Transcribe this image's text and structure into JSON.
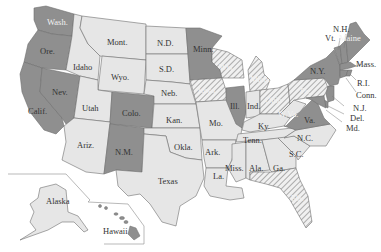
{
  "map": {
    "title": "",
    "colors": {
      "dark": "#8f8f8f",
      "light": "#e6e6e6",
      "hatch_bg": "#f0f0f0",
      "hatch_line": "#9a9a9a",
      "border": "#6f6f6f",
      "background": "#ffffff"
    },
    "categories": [
      "dark",
      "light",
      "hatched"
    ],
    "states": [
      {
        "name": "Wash.",
        "fill": "dark"
      },
      {
        "name": "Ore.",
        "fill": "dark"
      },
      {
        "name": "Calif.",
        "fill": "dark"
      },
      {
        "name": "Nev.",
        "fill": "dark"
      },
      {
        "name": "Idaho",
        "fill": "light"
      },
      {
        "name": "Mont.",
        "fill": "light"
      },
      {
        "name": "Wyo.",
        "fill": "light"
      },
      {
        "name": "Utah",
        "fill": "light"
      },
      {
        "name": "Colo.",
        "fill": "dark"
      },
      {
        "name": "Ariz.",
        "fill": "light"
      },
      {
        "name": "N.M.",
        "fill": "dark"
      },
      {
        "name": "N.D.",
        "fill": "light"
      },
      {
        "name": "S.D.",
        "fill": "light"
      },
      {
        "name": "Neb.",
        "fill": "light"
      },
      {
        "name": "Kan.",
        "fill": "light"
      },
      {
        "name": "Okla.",
        "fill": "light"
      },
      {
        "name": "Texas",
        "fill": "light"
      },
      {
        "name": "Minn.",
        "fill": "dark"
      },
      {
        "name": "Iowa",
        "fill": "hatched"
      },
      {
        "name": "Mo.",
        "fill": "light"
      },
      {
        "name": "Ark.",
        "fill": "light"
      },
      {
        "name": "La.",
        "fill": "light"
      },
      {
        "name": "Wis.",
        "fill": "hatched"
      },
      {
        "name": "Ill.",
        "fill": "dark"
      },
      {
        "name": "Mich.",
        "fill": "hatched"
      },
      {
        "name": "Ind.",
        "fill": "light"
      },
      {
        "name": "Ohio",
        "fill": "hatched"
      },
      {
        "name": "Ky.",
        "fill": "light"
      },
      {
        "name": "Tenn.",
        "fill": "light"
      },
      {
        "name": "Miss.",
        "fill": "light"
      },
      {
        "name": "Ala.",
        "fill": "light"
      },
      {
        "name": "Ga.",
        "fill": "light"
      },
      {
        "name": "Fla.",
        "fill": "hatched"
      },
      {
        "name": "S.C.",
        "fill": "light"
      },
      {
        "name": "N.C.",
        "fill": "light"
      },
      {
        "name": "Va.",
        "fill": "dark"
      },
      {
        "name": "W.Va.",
        "fill": "light"
      },
      {
        "name": "Pa.",
        "fill": "hatched"
      },
      {
        "name": "N.Y.",
        "fill": "dark"
      },
      {
        "name": "Vt.",
        "fill": "dark"
      },
      {
        "name": "N.H.",
        "fill": "dark"
      },
      {
        "name": "Maine",
        "fill": "dark"
      },
      {
        "name": "Mass.",
        "fill": "dark"
      },
      {
        "name": "R.I.",
        "fill": "dark"
      },
      {
        "name": "Conn.",
        "fill": "dark"
      },
      {
        "name": "N.J.",
        "fill": "dark"
      },
      {
        "name": "Del.",
        "fill": "dark"
      },
      {
        "name": "Md.",
        "fill": "dark"
      },
      {
        "name": "Alaska",
        "fill": "light"
      },
      {
        "name": "Hawaii",
        "fill": "dark"
      }
    ]
  },
  "labels": {
    "wash": "Wash.",
    "ore": "Ore.",
    "calif": "Calif.",
    "nev": "Nev.",
    "idaho": "Idaho",
    "mont": "Mont.",
    "wyo": "Wyo.",
    "utah": "Utah",
    "colo": "Colo.",
    "ariz": "Ariz.",
    "nm": "N.M.",
    "nd": "N.D.",
    "sd": "S.D.",
    "neb": "Neb.",
    "kan": "Kan.",
    "okla": "Okla.",
    "texas": "Texas",
    "minn": "Minn.",
    "iowa": "Iowa",
    "mo": "Mo.",
    "ark": "Ark.",
    "la": "La.",
    "wis": "Wis.",
    "ill": "Ill.",
    "mich": "Mich.",
    "ind": "Ind.",
    "ohio": "Ohio",
    "ky": "Ky.",
    "tenn": "Tenn.",
    "miss": "Miss.",
    "ala": "Ala.",
    "ga": "Ga.",
    "fla": "Fla.",
    "sc": "S.C.",
    "nc": "N.C.",
    "va": "Va.",
    "wva": "W.Va.",
    "pa": "Pa.",
    "ny": "N.Y.",
    "vt": "Vt.",
    "nh": "N.H.",
    "maine": "Maine",
    "mass": "Mass.",
    "ri": "R.I.",
    "conn": "Conn.",
    "nj": "N.J.",
    "del": "Del.",
    "md": "Md.",
    "alaska": "Alaska",
    "hawaii": "Hawaii"
  }
}
